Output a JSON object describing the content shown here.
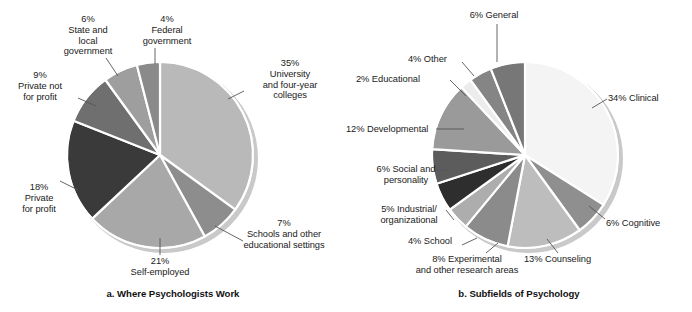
{
  "figure": {
    "background": "#ffffff",
    "width": 692,
    "height": 312
  },
  "panels": [
    {
      "id": "a",
      "caption": "a. Where Psychologists Work",
      "center": {
        "x": 160,
        "y": 155
      },
      "radius": 93,
      "start_angle": 0,
      "shadow_color": "#c9c9c9",
      "slice_gap_color": "#ffffff",
      "chart_data": {
        "type": "pie",
        "title": "a. Where Psychologists Work",
        "units": "percent",
        "total": 100,
        "categories": [
          "University and four-year colleges",
          "Schools and other educational settings",
          "Self-employed",
          "Private for profit",
          "Private not for profit",
          "State and local government",
          "Federal government"
        ],
        "values": [
          35,
          7,
          21,
          18,
          9,
          6,
          4
        ],
        "colors": [
          "#b9b9b9",
          "#8d8d8d",
          "#a8a8a8",
          "#3a3a3a",
          "#6f6f6f",
          "#9e9e9e",
          "#8a8a8a"
        ],
        "legend": "labels-with-leader-lines"
      },
      "labels": [
        {
          "name": "label-university",
          "text": "35%\nUniversity\nand four-year\ncolleges",
          "x": 238,
          "y": 58,
          "width": 104,
          "align": "center",
          "leader": {
            "x1": 228,
            "y1": 99,
            "x2": 244,
            "y2": 91
          }
        },
        {
          "name": "label-schools",
          "text": "7%\nSchools and other\neducational settings",
          "x": 222,
          "y": 218,
          "width": 124,
          "align": "center",
          "leader": {
            "x1": 215,
            "y1": 226,
            "x2": 243,
            "y2": 241
          }
        },
        {
          "name": "label-self-employed",
          "text": "21%\nSelf-employed",
          "x": 104,
          "y": 256,
          "width": 112,
          "align": "center",
          "leader": {
            "x1": 160,
            "y1": 238,
            "x2": 160,
            "y2": 255
          }
        },
        {
          "name": "label-private-for-profit",
          "text": "18%\nPrivate\nfor profit",
          "x": 2,
          "y": 182,
          "width": 74,
          "align": "center",
          "leader": {
            "x1": 78,
            "y1": 190,
            "x2": 60,
            "y2": 181
          }
        },
        {
          "name": "label-private-not-for-profit",
          "text": "9%\nPrivate not\nfor profit",
          "x": 3,
          "y": 70,
          "width": 74,
          "align": "center",
          "leader": {
            "x1": 96,
            "y1": 106,
            "x2": 78,
            "y2": 98
          }
        },
        {
          "name": "label-state-local-government",
          "text": "6%\nState and\nlocal\ngovernment",
          "x": 48,
          "y": 14,
          "width": 80,
          "align": "center",
          "leader": {
            "x1": 118,
            "y1": 76,
            "x2": 106,
            "y2": 58
          }
        },
        {
          "name": "label-federal-government",
          "text": "4%\nFederal\ngovernment",
          "x": 124,
          "y": 14,
          "width": 86,
          "align": "center",
          "leader": {
            "x1": 155,
            "y1": 64,
            "x2": 155,
            "y2": 48
          }
        }
      ]
    },
    {
      "id": "b",
      "caption": "b. Subfields of Psychology",
      "center": {
        "x": 179,
        "y": 155
      },
      "radius": 93,
      "start_angle": 0,
      "shadow_color": "#c9c9c9",
      "slice_gap_color": "#ffffff",
      "chart_data": {
        "type": "pie",
        "title": "b. Subfields of Psychology",
        "units": "percent",
        "total": 100,
        "categories": [
          "Clinical",
          "Cognitive",
          "Counseling",
          "Experimental and other research areas",
          "School",
          "Industrial/organizational",
          "Social and personality",
          "Developmental",
          "Educational",
          "Other",
          "General"
        ],
        "values": [
          34,
          6,
          13,
          8,
          4,
          5,
          6,
          12,
          2,
          4,
          6
        ],
        "colors": [
          "#f4f4f4",
          "#8f8f8f",
          "#bdbdbd",
          "#8b8b8b",
          "#adadad",
          "#2e2e2e",
          "#5c5c5c",
          "#9a9a9a",
          "#ececec",
          "#858585",
          "#777777"
        ],
        "legend": "labels-with-leader-lines"
      },
      "labels": [
        {
          "name": "label-general",
          "text": "6% General",
          "x": 96,
          "y": 10,
          "width": 104,
          "align": "center",
          "leader": {
            "x1": 151,
            "y1": 62,
            "x2": 151,
            "y2": 24
          }
        },
        {
          "name": "label-clinical",
          "text": "34% Clinical",
          "x": 262,
          "y": 93,
          "width": 80,
          "align": "left",
          "leader": {
            "x1": 246,
            "y1": 108,
            "x2": 261,
            "y2": 99
          }
        },
        {
          "name": "label-cognitive",
          "text": "6% Cognitive",
          "x": 260,
          "y": 218,
          "width": 84,
          "align": "left",
          "leader": {
            "x1": 243,
            "y1": 206,
            "x2": 259,
            "y2": 219
          }
        },
        {
          "name": "label-counseling",
          "text": "13% Counseling",
          "x": 178,
          "y": 254,
          "width": 100,
          "align": "left",
          "leader": {
            "x1": 201,
            "y1": 239,
            "x2": 212,
            "y2": 253
          }
        },
        {
          "name": "label-experimental",
          "text": "8% Experimental\nand other research areas",
          "x": 56,
          "y": 254,
          "width": 130,
          "align": "center",
          "leader": {
            "x1": 152,
            "y1": 243,
            "x2": 140,
            "y2": 253
          }
        },
        {
          "name": "label-school",
          "text": "4% School",
          "x": 62,
          "y": 236,
          "width": 70,
          "align": "left",
          "leader": {
            "x1": 131,
            "y1": 238,
            "x2": 116,
            "y2": 245
          }
        },
        {
          "name": "label-industrial-organizational",
          "text": "5% Industrial/\norganizational",
          "x": 22,
          "y": 204,
          "width": 82,
          "align": "center",
          "leader": {
            "x1": 108,
            "y1": 220,
            "x2": 100,
            "y2": 210
          }
        },
        {
          "name": "label-social-personality",
          "text": "6% Social and\npersonality",
          "x": 16,
          "y": 164,
          "width": 88,
          "align": "center",
          "leader": {
            "x1": 88,
            "y1": 170,
            "x2": 101,
            "y2": 170
          }
        },
        {
          "name": "label-developmental",
          "text": "12% Developmental",
          "x": 0,
          "y": 124,
          "width": 118,
          "align": "left",
          "leader": {
            "x1": 90,
            "y1": 129,
            "x2": 118,
            "y2": 129
          }
        },
        {
          "name": "label-educational",
          "text": "2% Educational",
          "x": 10,
          "y": 74,
          "width": 96,
          "align": "left",
          "leader": {
            "x1": 104,
            "y1": 80,
            "x2": 120,
            "y2": 96
          }
        },
        {
          "name": "label-other",
          "text": "4% Other",
          "x": 62,
          "y": 54,
          "width": 62,
          "align": "left",
          "leader": {
            "x1": 116,
            "y1": 62,
            "x2": 128,
            "y2": 76
          }
        }
      ]
    }
  ]
}
